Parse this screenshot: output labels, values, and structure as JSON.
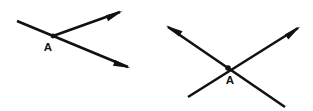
{
  "figure": {
    "background_color": "#ffffff",
    "line_color": "#111111",
    "label_color": "#111111"
  },
  "chart_data": {
    "type": "diagram",
    "title": "",
    "canvas": {
      "width": 313,
      "height": 111
    },
    "figures": [
      {
        "id": "left-angle",
        "vertex_label": "A",
        "vertex": {
          "x": 53,
          "y": 36
        },
        "label_position": {
          "x": 48,
          "y": 48
        },
        "segments": [
          {
            "id": "left-upper-ray",
            "from": {
              "x": 53,
              "y": 36
            },
            "to": {
              "x": 120,
              "y": 12
            },
            "arrow_at_end": true,
            "arrow_at_start": false
          },
          {
            "id": "left-lower-ray",
            "from": {
              "x": 17,
              "y": 21
            },
            "to": {
              "x": 128,
              "y": 67
            },
            "arrow_at_end": true,
            "arrow_at_start": false
          }
        ]
      },
      {
        "id": "right-crossing-lines",
        "vertex_label": "A",
        "vertex": {
          "x": 228,
          "y": 68
        },
        "label_position": {
          "x": 230,
          "y": 81
        },
        "segments": [
          {
            "id": "right-line-northwest",
            "from": {
              "x": 285,
              "y": 107
            },
            "to": {
              "x": 168,
              "y": 27
            },
            "arrow_at_end": true,
            "arrow_at_start": false
          },
          {
            "id": "right-line-northeast",
            "from": {
              "x": 188,
              "y": 97
            },
            "to": {
              "x": 298,
              "y": 28
            },
            "arrow_at_end": true,
            "arrow_at_start": false
          }
        ]
      }
    ]
  }
}
